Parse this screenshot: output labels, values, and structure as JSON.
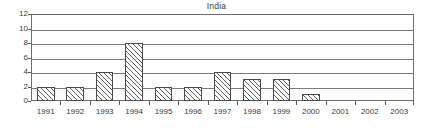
{
  "chart_data": {
    "type": "bar",
    "title": "India",
    "xlabel": "",
    "ylabel": "",
    "categories": [
      "1991",
      "1992",
      "1993",
      "1994",
      "1995",
      "1996",
      "1997",
      "1998",
      "1999",
      "2000",
      "2001",
      "2002",
      "2003"
    ],
    "values": [
      2,
      2,
      4,
      8,
      2,
      2,
      4,
      3,
      3,
      1,
      0,
      0,
      0
    ],
    "series": [
      {
        "name": "India",
        "values": [
          2,
          2,
          4,
          8,
          2,
          2,
          4,
          3,
          3,
          1,
          0,
          0,
          0
        ]
      }
    ],
    "ylim": [
      0,
      12
    ],
    "y_ticks": [
      0,
      2,
      4,
      6,
      8,
      10,
      12
    ],
    "y_tick_labels": [
      "0",
      "2",
      "4",
      "6",
      "8",
      "10",
      "12"
    ],
    "grid": true,
    "grid_axis": "y",
    "legend": false,
    "legend_position": "none",
    "bar_fill": "hatch-diagonal",
    "colors": {
      "axis": "#6e6e6e",
      "grid": "#7a7a7a",
      "bar_outline": "#4a4a4a",
      "bar_hatch": "#5d5d5d",
      "text": "#3a3a3a",
      "background": "#ffffff"
    }
  }
}
